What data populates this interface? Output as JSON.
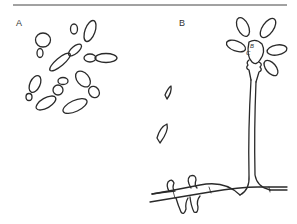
{
  "figure": {
    "panels": [
      {
        "label": "A",
        "content": "spores / budding cells"
      },
      {
        "label": "B",
        "content": "conidiophore with vesicle and hyphae"
      }
    ],
    "annotations": [
      "B",
      "C"
    ],
    "colors": {
      "ink": "#2a2a2a",
      "background": "#ffffff"
    }
  }
}
